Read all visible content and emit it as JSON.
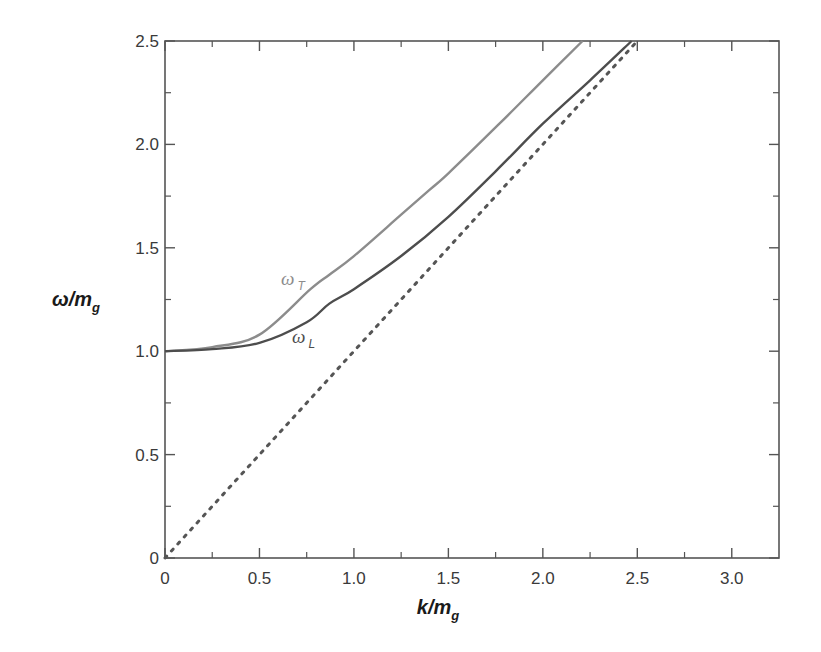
{
  "chart_data": {
    "type": "line",
    "title": "",
    "xlabel": "k/m_g",
    "ylabel": "ω/m_g",
    "xlim": [
      0,
      3.25
    ],
    "ylim": [
      0,
      2.5
    ],
    "grid": false,
    "legend": "none (curves labeled inline)",
    "x_ticks": [
      "0",
      "0.5",
      "1.0",
      "1.5",
      "2.0",
      "2.5",
      "3.0"
    ],
    "y_ticks": [
      "0",
      "0.5",
      "1.0",
      "1.5",
      "2.0",
      "2.5"
    ],
    "series": [
      {
        "name": "ω_T",
        "label_main": "ω",
        "label_sub": "T",
        "style": "solid",
        "color": "#8c8c8c",
        "x": [
          0,
          0.25,
          0.5,
          0.77,
          0.87,
          1.0,
          1.25,
          1.4,
          1.5,
          1.77,
          2.0,
          2.21
        ],
        "y": [
          1.0,
          1.02,
          1.08,
          1.3,
          1.37,
          1.46,
          1.66,
          1.78,
          1.86,
          2.1,
          2.31,
          2.5
        ]
      },
      {
        "name": "ω_L",
        "label_main": "ω",
        "label_sub": "L",
        "style": "solid",
        "color": "#4d4d4d",
        "x": [
          0,
          0.25,
          0.5,
          0.75,
          0.87,
          1.0,
          1.25,
          1.5,
          1.75,
          2.0,
          2.25,
          2.47
        ],
        "y": [
          1.0,
          1.01,
          1.04,
          1.14,
          1.23,
          1.3,
          1.46,
          1.65,
          1.87,
          2.1,
          2.31,
          2.5
        ]
      },
      {
        "name": "light cone ω = k",
        "style": "dotted",
        "color": "#555555",
        "x": [
          0,
          2.5
        ],
        "y": [
          0,
          2.5
        ]
      }
    ],
    "annotations": [
      {
        "text": "ω_T",
        "x": 0.62,
        "y": 1.36
      },
      {
        "text": "ω_L",
        "x": 0.68,
        "y": 1.08
      }
    ]
  },
  "axes": {
    "x_title_main": "k/m",
    "x_title_sub": "g",
    "y_title_main": "ω/m",
    "y_title_sub": "g"
  }
}
